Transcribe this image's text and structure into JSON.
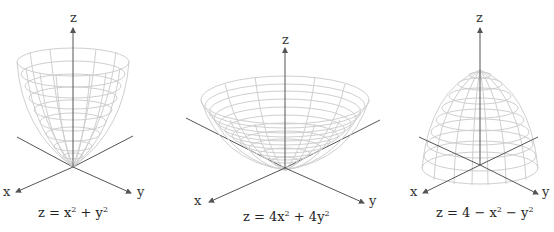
{
  "panels": [
    {
      "equation": "z = x² + y²",
      "eq_parts": {
        "pre": "z = x",
        "mid": " + y",
        "post": ""
      },
      "axes": {
        "x": "x",
        "y": "y",
        "z": "z"
      },
      "shape": "narrow upward paraboloid"
    },
    {
      "equation": "z = 4x² + 4y²",
      "eq_parts": {
        "pre": "z = 4x",
        "mid": " + 4y",
        "post": ""
      },
      "axes": {
        "x": "x",
        "y": "y",
        "z": "z"
      },
      "shape": "wide upward paraboloid"
    },
    {
      "equation": "z = 4 − x² − y²",
      "eq_parts": {
        "pre": "z = 4 − x",
        "mid": " − y",
        "post": ""
      },
      "axes": {
        "x": "x",
        "y": "y",
        "z": "z"
      },
      "shape": "downward paraboloid"
    }
  ],
  "colors": {
    "mesh": "#cfcfcf",
    "axis": "#555555",
    "text": "#222222"
  }
}
